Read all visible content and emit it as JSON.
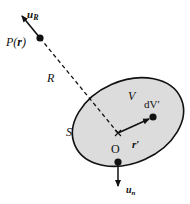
{
  "diagram": {
    "colors": {
      "ink": "#111111",
      "fill": "#dcdcdc",
      "background": "#ffffff"
    },
    "labels": {
      "u_R_main": "u",
      "u_R_sub": "R",
      "point_P": "P(",
      "point_P_r": "r",
      "point_P_close": ")",
      "distance_R": "R",
      "volume_V": "V",
      "element_dV": "dV′",
      "vector_r": "r′",
      "origin_O": "O",
      "surface_S": "S",
      "u_n_main": "u",
      "u_n_sub": "n"
    }
  }
}
